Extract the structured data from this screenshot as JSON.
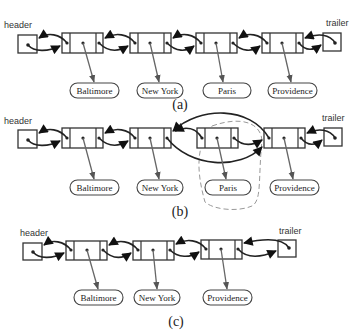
{
  "figure": {
    "sentinels": {
      "header_label": "header",
      "trailer_label": "trailer"
    },
    "panels": [
      {
        "caption": "(a)",
        "nodes": [
          "Baltimore",
          "New York",
          "Paris",
          "Providence"
        ],
        "state": "before removal"
      },
      {
        "caption": "(b)",
        "nodes": [
          "Baltimore",
          "New York",
          "Paris",
          "Providence"
        ],
        "removed_node": "Paris",
        "state": "linking out the old node"
      },
      {
        "caption": "(c)",
        "nodes": [
          "Baltimore",
          "New York",
          "Providence"
        ],
        "state": "after removal"
      }
    ]
  }
}
